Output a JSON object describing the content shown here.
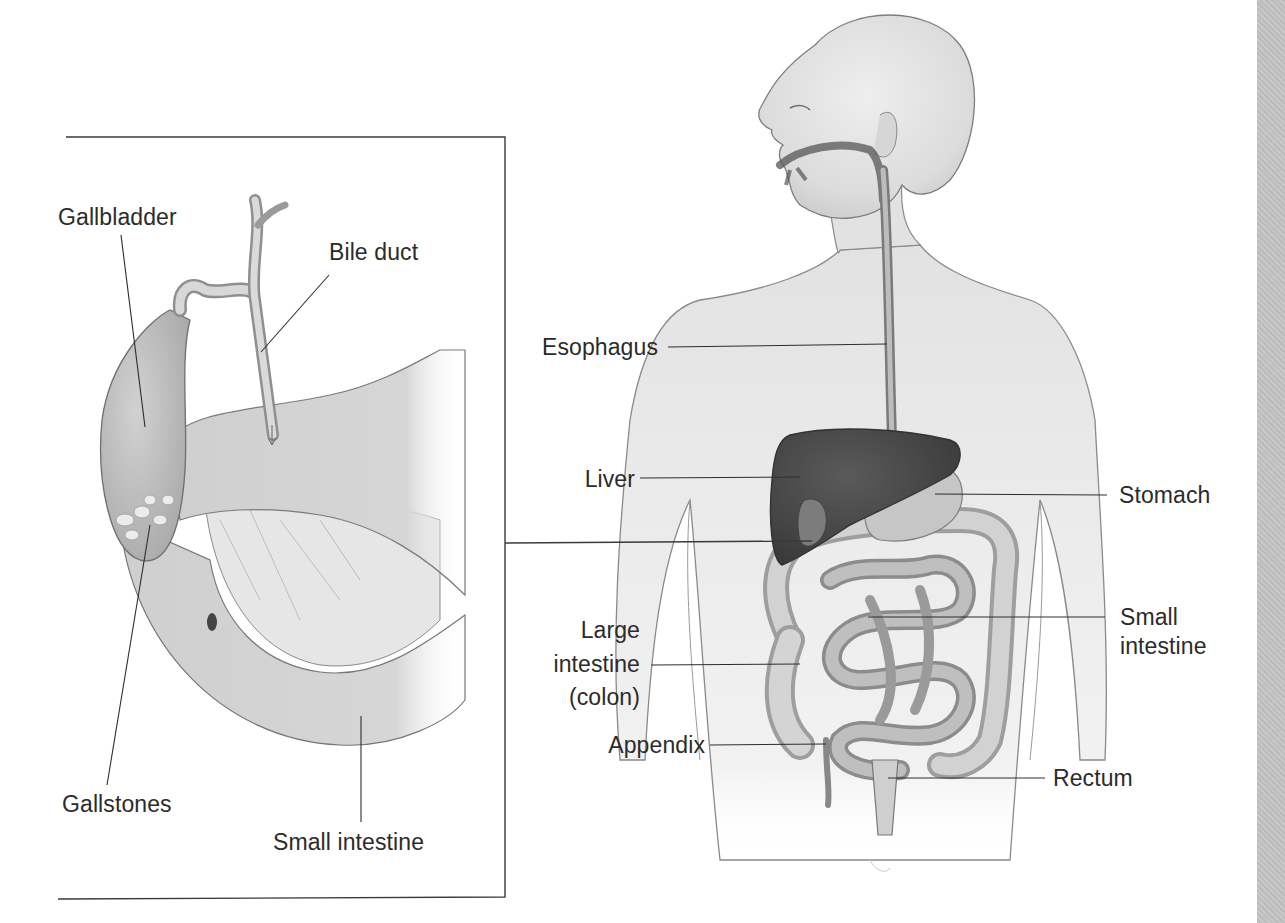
{
  "figure": {
    "inset": {
      "name": "gallbladder-detail",
      "labels": {
        "gallbladder": "Gallbladder",
        "bile_duct": "Bile duct",
        "gallstones": "Gallstones",
        "small_intestine": "Small intestine"
      }
    },
    "body": {
      "labels": {
        "esophagus": "Esophagus",
        "liver": "Liver",
        "stomach": "Stomach",
        "small_intestine_line1": "Small",
        "small_intestine_line2": "intestine",
        "large_intestine_line1": "Large",
        "large_intestine_line2": "intestine",
        "large_intestine_line3": "(colon)",
        "appendix": "Appendix",
        "rectum": "Rectum"
      }
    },
    "colors": {
      "background": "#ffffff",
      "line": "#333333",
      "skin": "#e4e4e4",
      "organ_dark": "#4a4a4a",
      "organ_mid": "#9a9a9a",
      "organ_light": "#cfcfcf",
      "side_strip": "#c3c3c3"
    }
  }
}
